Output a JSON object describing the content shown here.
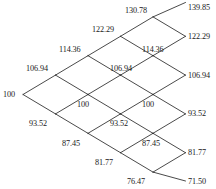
{
  "diagram": {
    "type": "binomial-lattice",
    "title": "",
    "steps": 5,
    "root_value": "100",
    "geometry": {
      "column_x": [
        23,
        55.5,
        88,
        120.5,
        153,
        185.5
      ],
      "row_spacing_y": 19.4,
      "center_y": 94.5
    },
    "nodes": [
      {
        "id": "n0-0",
        "step": 0,
        "up_moves": 0,
        "label": "100",
        "node_x": 23,
        "node_y": 94.5,
        "label_x": 3,
        "label_y": 89.5,
        "label_align": "right"
      },
      {
        "id": "n1-1",
        "step": 1,
        "up_moves": 1,
        "label": "106.94",
        "node_x": 55.5,
        "node_y": 75.1,
        "label_x": 26,
        "label_y": 63.5,
        "label_align": "left"
      },
      {
        "id": "n1-0",
        "step": 1,
        "up_moves": 0,
        "label": "93.52",
        "node_x": 55.5,
        "node_y": 113.9,
        "label_x": 29,
        "label_y": 119.0,
        "label_align": "left"
      },
      {
        "id": "n2-2",
        "step": 2,
        "up_moves": 2,
        "label": "114.36",
        "node_x": 88,
        "node_y": 55.7,
        "label_x": 59,
        "label_y": 44.5,
        "label_align": "left"
      },
      {
        "id": "n2-1",
        "step": 2,
        "up_moves": 1,
        "label": "100",
        "node_x": 88,
        "node_y": 94.5,
        "label_x": 77,
        "label_y": 100.0,
        "label_align": "left"
      },
      {
        "id": "n2-0",
        "step": 2,
        "up_moves": 0,
        "label": "87.45",
        "node_x": 88,
        "node_y": 133.3,
        "label_x": 62,
        "label_y": 138.5,
        "label_align": "left"
      },
      {
        "id": "n3-3",
        "step": 3,
        "up_moves": 3,
        "label": "122.29",
        "node_x": 120.5,
        "node_y": 36.3,
        "label_x": 92,
        "label_y": 25.0,
        "label_align": "left"
      },
      {
        "id": "n3-2",
        "step": 3,
        "up_moves": 2,
        "label": "106.94",
        "node_x": 120.5,
        "node_y": 75.1,
        "label_x": 110,
        "label_y": 63.5,
        "label_align": "left"
      },
      {
        "id": "n3-1",
        "step": 3,
        "up_moves": 1,
        "label": "93.52",
        "node_x": 120.5,
        "node_y": 113.9,
        "label_x": 110,
        "label_y": 119.0,
        "label_align": "left"
      },
      {
        "id": "n3-0",
        "step": 3,
        "up_moves": 0,
        "label": "81.77",
        "node_x": 120.5,
        "node_y": 152.7,
        "label_x": 95,
        "label_y": 157.5,
        "label_align": "left"
      },
      {
        "id": "n4-4",
        "step": 4,
        "up_moves": 4,
        "label": "130.78",
        "node_x": 153,
        "node_y": 16.9,
        "label_x": 125,
        "label_y": 6.0,
        "label_align": "left"
      },
      {
        "id": "n4-3",
        "step": 4,
        "up_moves": 3,
        "label": "114.36",
        "node_x": 153,
        "node_y": 55.7,
        "label_x": 142,
        "label_y": 44.5,
        "label_align": "left"
      },
      {
        "id": "n4-2",
        "step": 4,
        "up_moves": 2,
        "label": "100",
        "node_x": 153,
        "node_y": 94.5,
        "label_x": 142,
        "label_y": 100.0,
        "label_align": "left"
      },
      {
        "id": "n4-1",
        "step": 4,
        "up_moves": 1,
        "label": "87.45",
        "node_x": 153,
        "node_y": 133.3,
        "label_x": 142,
        "label_y": 138.5,
        "label_align": "left"
      },
      {
        "id": "n4-0",
        "step": 4,
        "up_moves": 0,
        "label": "76.47",
        "node_x": 153,
        "node_y": 172.1,
        "label_x": 127,
        "label_y": 176.5,
        "label_align": "left"
      },
      {
        "id": "n5-5",
        "step": 5,
        "up_moves": 5,
        "label": "139.85",
        "node_x": 185.5,
        "node_y": 2.5,
        "label_x": 188,
        "label_y": 3.0,
        "label_align": "left"
      },
      {
        "id": "n5-4",
        "step": 5,
        "up_moves": 4,
        "label": "122.29",
        "node_x": 185.5,
        "node_y": 36.3,
        "label_x": 188,
        "label_y": 31.5,
        "label_align": "left"
      },
      {
        "id": "n5-3",
        "step": 5,
        "up_moves": 3,
        "label": "106.94",
        "node_x": 185.5,
        "node_y": 75.1,
        "label_x": 188,
        "label_y": 70.5,
        "label_align": "left"
      },
      {
        "id": "n5-2",
        "step": 5,
        "up_moves": 2,
        "label": "93.52",
        "node_x": 185.5,
        "node_y": 113.9,
        "label_x": 188,
        "label_y": 109.0,
        "label_align": "left"
      },
      {
        "id": "n5-1",
        "step": 5,
        "up_moves": 1,
        "label": "81.77",
        "node_x": 185.5,
        "node_y": 152.7,
        "label_x": 188,
        "label_y": 147.5,
        "label_align": "left"
      },
      {
        "id": "n5-0",
        "step": 5,
        "up_moves": 0,
        "label": "71.50",
        "node_x": 185.5,
        "node_y": 181.0,
        "label_x": 188,
        "label_y": 176.5,
        "label_align": "left"
      }
    ],
    "edges": [
      [
        "n0-0",
        "n1-1"
      ],
      [
        "n0-0",
        "n1-0"
      ],
      [
        "n1-1",
        "n2-2"
      ],
      [
        "n1-1",
        "n2-1"
      ],
      [
        "n1-0",
        "n2-1"
      ],
      [
        "n1-0",
        "n2-0"
      ],
      [
        "n2-2",
        "n3-3"
      ],
      [
        "n2-2",
        "n3-2"
      ],
      [
        "n2-1",
        "n3-2"
      ],
      [
        "n2-1",
        "n3-1"
      ],
      [
        "n2-0",
        "n3-1"
      ],
      [
        "n2-0",
        "n3-0"
      ],
      [
        "n3-3",
        "n4-4"
      ],
      [
        "n3-3",
        "n4-3"
      ],
      [
        "n3-2",
        "n4-3"
      ],
      [
        "n3-2",
        "n4-2"
      ],
      [
        "n3-1",
        "n4-2"
      ],
      [
        "n3-1",
        "n4-1"
      ],
      [
        "n3-0",
        "n4-1"
      ],
      [
        "n3-0",
        "n4-0"
      ],
      [
        "n4-4",
        "n5-5"
      ],
      [
        "n4-4",
        "n5-4"
      ],
      [
        "n4-3",
        "n5-4"
      ],
      [
        "n4-3",
        "n5-3"
      ],
      [
        "n4-2",
        "n5-3"
      ],
      [
        "n4-2",
        "n5-2"
      ],
      [
        "n4-1",
        "n5-2"
      ],
      [
        "n4-1",
        "n5-1"
      ],
      [
        "n4-0",
        "n5-1"
      ],
      [
        "n4-0",
        "n5-0"
      ]
    ],
    "style": {
      "line_color": "#1c1c1c",
      "line_width": 0.8,
      "text_color": "#1a1a1a",
      "background": "#ffffff"
    }
  }
}
